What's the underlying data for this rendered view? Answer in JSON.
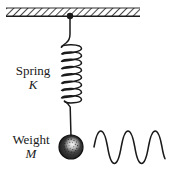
{
  "figure": {
    "width": 172,
    "height": 178,
    "background_color": "#ffffff",
    "ink_color": "#1a1a1a"
  },
  "labels": {
    "spring": {
      "name": "Spring",
      "symbol": "K"
    },
    "weight": {
      "name": "Weight",
      "symbol": "M"
    }
  },
  "elements": {
    "ceiling": {
      "icon_name": "hatched-ceiling",
      "x": 6,
      "y": 8,
      "width": 134,
      "height": 8,
      "hatch_angle_deg": 45,
      "color": "#1a1a1a"
    },
    "anchor_point": {
      "icon_name": "anchor-dot",
      "cx": 70,
      "cy": 16,
      "r": 3.2,
      "color": "#1a1a1a"
    },
    "upper_wire": {
      "icon_name": "wire-segment",
      "x": 70,
      "y_start": 16,
      "y_end": 46
    },
    "spring_coil": {
      "icon_name": "helical-spring",
      "center_x": 71,
      "y_top": 46,
      "y_bottom": 103,
      "coil_count": 8,
      "radius_x": 11,
      "radius_y": 4.6
    },
    "lower_wire": {
      "icon_name": "wire-segment",
      "x": 71,
      "y_start": 103,
      "y_end": 137
    },
    "mass_ball": {
      "icon_name": "weight-sphere",
      "cx": 71,
      "cy": 147,
      "r": 12,
      "fill": "#2b2b2b",
      "highlight_fill": "#f2f2f2",
      "stipple": true
    },
    "oscillation_wave": {
      "icon_name": "sine-wave",
      "x_start": 94,
      "x_end": 165,
      "baseline_y": 147,
      "amplitude": 16,
      "cycles": 4.1,
      "phase": "rising-from-baseline"
    }
  }
}
